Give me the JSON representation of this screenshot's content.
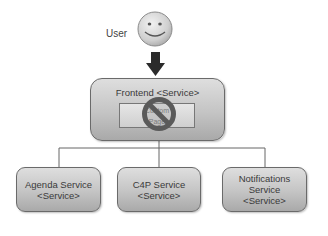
{
  "diagram": {
    "actor": {
      "label": "User",
      "icon": "smiley-face-icon"
    },
    "arrow": {
      "icon": "arrow-down-icon",
      "color": "#2b2b2b"
    },
    "frontend": {
      "title": "Frontend <Service>",
      "inner_component": {
        "label": "Custom\nPage",
        "status_icon": "no-entry-icon",
        "status_color": "#5a5a5a"
      }
    },
    "services": [
      {
        "name": "Agenda Service\n<Service>"
      },
      {
        "name": "C4P Service\n<Service>"
      },
      {
        "name": "Notifications\nService\n<Service>"
      }
    ],
    "colors": {
      "box_top": "#dedede",
      "box_bottom": "#a9a9a9",
      "border": "#6a6a6a",
      "connector": "#666666"
    }
  }
}
